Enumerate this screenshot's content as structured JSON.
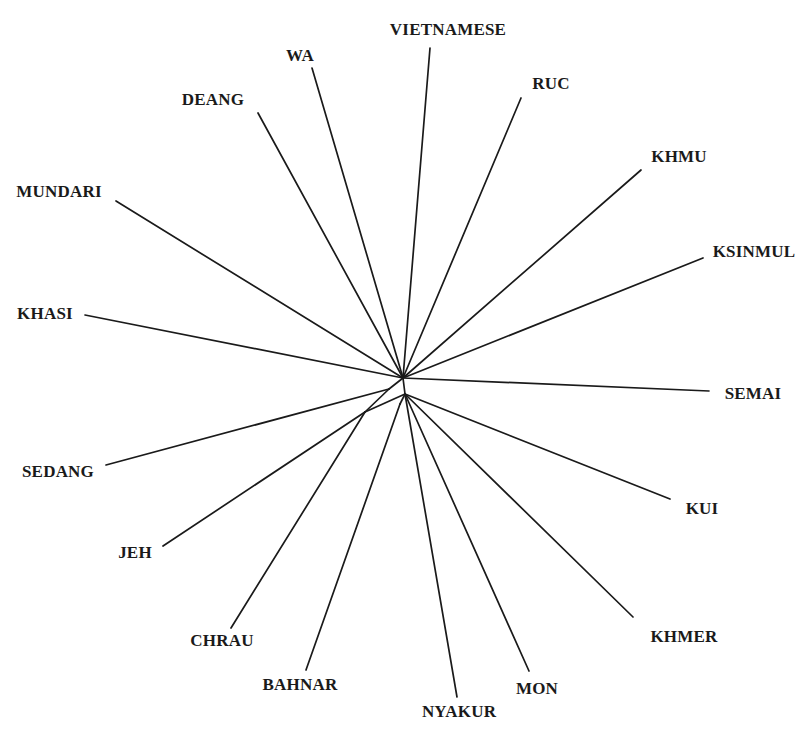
{
  "figure": {
    "background_color": "#ffffff",
    "line_color": "#1a1a1a",
    "label_color": "#1a1a1a"
  },
  "chart_data": {
    "type": "diagram",
    "diagram_kind": "unrooted-phylogenetic-network",
    "title": "",
    "xlabel": "",
    "ylabel": "",
    "grid": false,
    "legend": null,
    "canvas": {
      "width": 808,
      "height": 741
    },
    "internal_nodes": [
      {
        "id": "hub_upper",
        "x": 403,
        "y": 378
      },
      {
        "id": "hub_lower",
        "x": 405,
        "y": 394
      },
      {
        "id": "node_west",
        "x": 389,
        "y": 389
      },
      {
        "id": "node_sw",
        "x": 365,
        "y": 412
      },
      {
        "id": "node_s",
        "x": 400,
        "y": 404
      }
    ],
    "internal_edges": [
      {
        "from": "hub_upper",
        "to": "hub_lower"
      },
      {
        "from": "hub_upper",
        "to": "node_west"
      },
      {
        "from": "node_west",
        "to": "node_sw"
      },
      {
        "from": "hub_lower",
        "to": "node_sw"
      },
      {
        "from": "hub_lower",
        "to": "node_s"
      }
    ],
    "taxa": [
      {
        "name": "VIETNAMESE",
        "tip_x": 430,
        "tip_y": 48,
        "attach": "hub_upper",
        "label_x": 448,
        "label_y": 30,
        "anchor": "mid"
      },
      {
        "name": "WA",
        "tip_x": 312,
        "tip_y": 68,
        "attach": "hub_upper",
        "label_x": 300,
        "label_y": 56,
        "anchor": "mid"
      },
      {
        "name": "RUC",
        "tip_x": 521,
        "tip_y": 98,
        "attach": "hub_upper",
        "label_x": 551,
        "label_y": 84,
        "anchor": "mid"
      },
      {
        "name": "DEANG",
        "tip_x": 258,
        "tip_y": 113,
        "attach": "hub_upper",
        "label_x": 213,
        "label_y": 100,
        "anchor": "mid"
      },
      {
        "name": "KHMU",
        "tip_x": 641,
        "tip_y": 170,
        "attach": "hub_upper",
        "label_x": 679,
        "label_y": 157,
        "anchor": "mid"
      },
      {
        "name": "MUNDARI",
        "tip_x": 116,
        "tip_y": 201,
        "attach": "hub_upper",
        "label_x": 59,
        "label_y": 192,
        "anchor": "mid"
      },
      {
        "name": "KSINMUL",
        "tip_x": 703,
        "tip_y": 258,
        "attach": "hub_upper",
        "label_x": 754,
        "label_y": 252,
        "anchor": "mid"
      },
      {
        "name": "KHASI",
        "tip_x": 85,
        "tip_y": 315,
        "attach": "hub_upper",
        "label_x": 45,
        "label_y": 314,
        "anchor": "mid"
      },
      {
        "name": "SEMAI",
        "tip_x": 709,
        "tip_y": 391,
        "attach": "hub_upper",
        "label_x": 753,
        "label_y": 394,
        "anchor": "mid"
      },
      {
        "name": "SEDANG",
        "tip_x": 106,
        "tip_y": 465,
        "attach": "node_west",
        "label_x": 58,
        "label_y": 472,
        "anchor": "mid"
      },
      {
        "name": "KUI",
        "tip_x": 670,
        "tip_y": 499,
        "attach": "hub_lower",
        "label_x": 702,
        "label_y": 509,
        "anchor": "mid"
      },
      {
        "name": "JEH",
        "tip_x": 163,
        "tip_y": 546,
        "attach": "node_sw",
        "label_x": 135,
        "label_y": 553,
        "anchor": "mid"
      },
      {
        "name": "KHMER",
        "tip_x": 633,
        "tip_y": 617,
        "attach": "hub_lower",
        "label_x": 684,
        "label_y": 637,
        "anchor": "mid"
      },
      {
        "name": "CHRAU",
        "tip_x": 231,
        "tip_y": 628,
        "attach": "node_sw",
        "label_x": 222,
        "label_y": 641,
        "anchor": "mid"
      },
      {
        "name": "BAHNAR",
        "tip_x": 306,
        "tip_y": 670,
        "attach": "node_s",
        "label_x": 300,
        "label_y": 685,
        "anchor": "mid"
      },
      {
        "name": "MON",
        "tip_x": 529,
        "tip_y": 671,
        "attach": "hub_lower",
        "label_x": 537,
        "label_y": 689,
        "anchor": "mid"
      },
      {
        "name": "NYAKUR",
        "tip_x": 457,
        "tip_y": 697,
        "attach": "hub_lower",
        "label_x": 459,
        "label_y": 712,
        "anchor": "mid"
      }
    ],
    "taxa_count": 17
  }
}
